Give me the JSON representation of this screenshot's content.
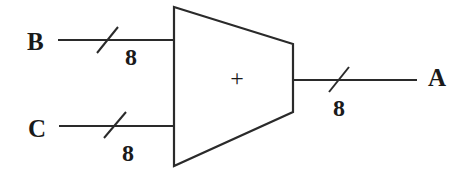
{
  "diagram": {
    "type": "adder-block",
    "component": {
      "name": "adder",
      "operator_symbol": "+"
    },
    "inputs": [
      {
        "name": "B",
        "bus_width": "8"
      },
      {
        "name": "C",
        "bus_width": "8"
      }
    ],
    "outputs": [
      {
        "name": "A",
        "bus_width": "8"
      }
    ],
    "colors": {
      "stroke": "#2a2a2a",
      "text": "#1a1a1a",
      "background": "#ffffff"
    }
  }
}
